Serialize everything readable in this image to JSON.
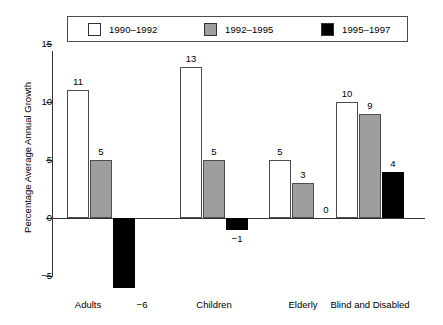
{
  "chart_data": {
    "type": "bar",
    "title": "",
    "xlabel": "",
    "ylabel": "Percentage Average Annual Growth",
    "ylim": [
      -7,
      15
    ],
    "yticks": [
      15,
      10,
      5,
      0,
      -5
    ],
    "ytick_labels": [
      "15",
      "10",
      "5",
      "0",
      "−5"
    ],
    "grid": false,
    "legend_position": "top",
    "categories": [
      "Adults",
      "Children",
      "Elderly",
      "Blind and Disabled"
    ],
    "series": [
      {
        "name": "1990–1992",
        "color": "#ffffff",
        "values": [
          11,
          13,
          5,
          10
        ],
        "value_labels": [
          "11",
          "13",
          "5",
          "10"
        ]
      },
      {
        "name": "1992–1995",
        "color": "#9e9e9e",
        "values": [
          5,
          5,
          3,
          9
        ],
        "value_labels": [
          "5",
          "5",
          "3",
          "9"
        ]
      },
      {
        "name": "1995–1997",
        "color": "#000000",
        "values": [
          -6,
          -1,
          0,
          4
        ],
        "value_labels": [
          "−6",
          "−1",
          "0",
          "4"
        ]
      }
    ]
  },
  "legend": {
    "items": [
      {
        "label": "1990–1992",
        "swatch": "#ffffff"
      },
      {
        "label": "1992–1995",
        "swatch": "#9e9e9e"
      },
      {
        "label": "1995–1997",
        "swatch": "#000000"
      }
    ]
  },
  "axis": {
    "y_title": "Percentage Average Annual Growth",
    "y_ticks": [
      "15",
      "10",
      "5",
      "0",
      "−5"
    ]
  },
  "categories": [
    {
      "label": "Adults"
    },
    {
      "label": "Children"
    },
    {
      "label": "Elderly"
    },
    {
      "label": "Blind and Disabled"
    }
  ],
  "colors": {
    "series_1990_1992": "#ffffff",
    "series_1992_1995": "#9e9e9e",
    "series_1995_1997": "#000000",
    "axis": "#333333",
    "background": "#ffffff"
  }
}
